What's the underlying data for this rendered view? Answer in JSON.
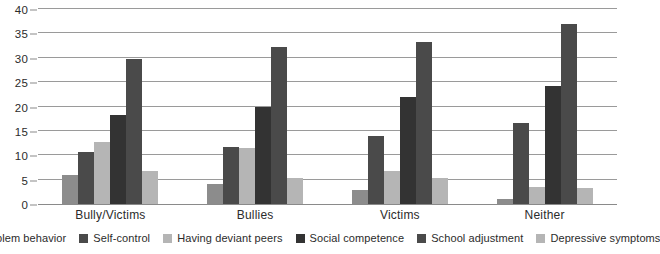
{
  "chart_data": {
    "type": "bar",
    "title": "",
    "subtitle": "",
    "xlabel": "",
    "ylabel": "",
    "ylim": [
      0,
      40
    ],
    "yticks": [
      0,
      5,
      10,
      15,
      20,
      25,
      30,
      35,
      40
    ],
    "ytick_labels": [
      "0",
      "5",
      "10",
      "15",
      "20",
      "25",
      "30",
      "35",
      "40"
    ],
    "grid": true,
    "legend_position": "bottom",
    "categories": [
      "Bully/Victims",
      "Bullies",
      "Victims",
      "Neither"
    ],
    "series": [
      {
        "name": "Problem behavior",
        "color": "#8c8c8c",
        "values": [
          5.9,
          4.2,
          2.9,
          1.0
        ]
      },
      {
        "name": "Self-control",
        "color": "#4a4a4a",
        "values": [
          10.7,
          11.6,
          14.0,
          16.6
        ]
      },
      {
        "name": "Having deviant peers",
        "color": "#b5b5b5",
        "values": [
          12.7,
          11.5,
          6.8,
          3.5
        ]
      },
      {
        "name": "Social competence",
        "color": "#333333",
        "values": [
          18.3,
          19.9,
          22.0,
          24.2
        ]
      },
      {
        "name": "School adjustment",
        "color": "#4a4a4a",
        "values": [
          29.8,
          32.3,
          33.3,
          36.9
        ]
      },
      {
        "name": "Depressive symptoms",
        "color": "#b5b5b5",
        "values": [
          6.7,
          5.3,
          5.4,
          3.3
        ]
      }
    ]
  },
  "axis": {
    "tick_color": "#8a8a8a",
    "grid_color": "#9a9a9a"
  }
}
